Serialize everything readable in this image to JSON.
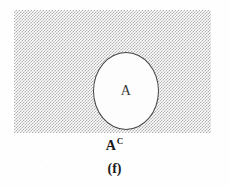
{
  "figure": {
    "caption": "(f)",
    "universe": {
      "name": "universal-set-region",
      "fill_style": "gray-stipple-halftone",
      "fill_color": "#a9a9a9",
      "border_color": "#2b2b2b"
    },
    "set_a": {
      "label": "A",
      "fill_color": "#fdfdfd",
      "border_color": "#303030"
    },
    "complement": {
      "base": "A",
      "superscript": "C",
      "full_text": "Aᶜ"
    }
  }
}
